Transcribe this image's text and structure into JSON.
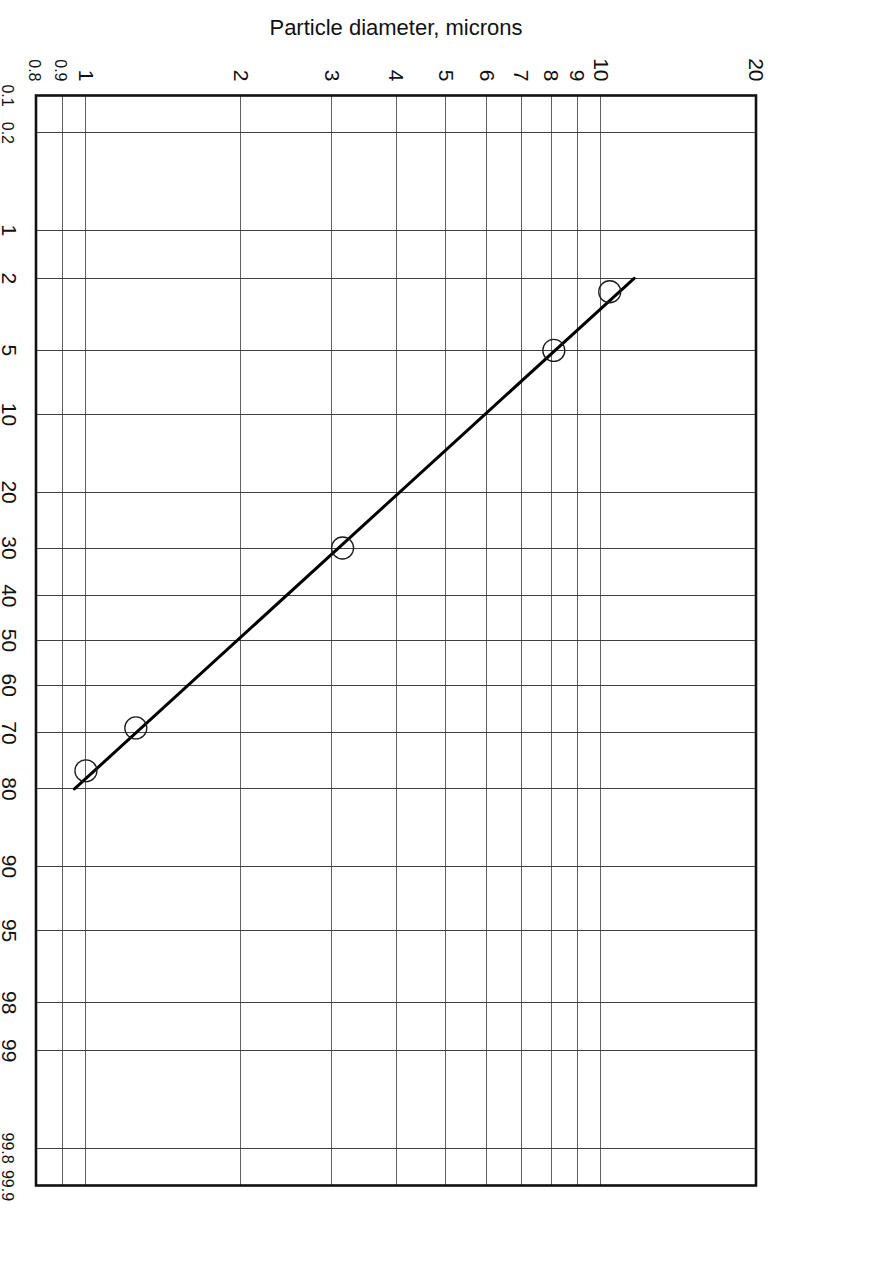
{
  "figure": {
    "orientation_deg": 90,
    "background": "#ffffff",
    "frame_color": "#111111",
    "grid_color": "#2b2b2b",
    "data_color": "#000000"
  },
  "chart_data": {
    "type": "line",
    "title": "",
    "subtitle": "",
    "xlabel": "% Greater than stated size",
    "ylabel": "Particle diameter, microns",
    "x_scale": "probability",
    "y_scale": "log",
    "xlim": [
      0.1,
      99.9
    ],
    "ylim": [
      0.8,
      20
    ],
    "grid": true,
    "legend": null,
    "x_ticks": [
      {
        "value": 0.1,
        "label": "0.1"
      },
      {
        "value": 0.2,
        "label": "0.2"
      },
      {
        "value": 1,
        "label": "1"
      },
      {
        "value": 2,
        "label": "2"
      },
      {
        "value": 5,
        "label": "5"
      },
      {
        "value": 10,
        "label": "10"
      },
      {
        "value": 20,
        "label": "20"
      },
      {
        "value": 30,
        "label": "30"
      },
      {
        "value": 40,
        "label": "40"
      },
      {
        "value": 50,
        "label": "50"
      },
      {
        "value": 60,
        "label": "60"
      },
      {
        "value": 70,
        "label": "70"
      },
      {
        "value": 80,
        "label": "80"
      },
      {
        "value": 90,
        "label": "90"
      },
      {
        "value": 95,
        "label": "95"
      },
      {
        "value": 98,
        "label": "98"
      },
      {
        "value": 99,
        "label": "99"
      },
      {
        "value": 99.8,
        "label": "99.8"
      },
      {
        "value": 99.9,
        "label": "99.9"
      }
    ],
    "y_ticks": [
      {
        "value": 0.8,
        "label": "0.8"
      },
      {
        "value": 0.9,
        "label": "0.9"
      },
      {
        "value": 1,
        "label": "1"
      },
      {
        "value": 2,
        "label": "2"
      },
      {
        "value": 3,
        "label": "3"
      },
      {
        "value": 4,
        "label": "4"
      },
      {
        "value": 5,
        "label": "5"
      },
      {
        "value": 6,
        "label": "6"
      },
      {
        "value": 7,
        "label": "7"
      },
      {
        "value": 8,
        "label": "8"
      },
      {
        "value": 9,
        "label": "9"
      },
      {
        "value": 10,
        "label": "10"
      },
      {
        "value": 20,
        "label": "20"
      }
    ],
    "series": [
      {
        "name": "particle size distribution",
        "marker": "open-circle",
        "line": "solid",
        "x": [
          2.4,
          5.0,
          30.0,
          69.0,
          77.0
        ],
        "y": [
          10.4,
          8.1,
          3.15,
          1.25,
          1.0
        ]
      }
    ],
    "fit_line": {
      "name": "best fit line",
      "x_start": 2.0,
      "y_start": 11.6,
      "x_end": 80.0,
      "y_end": 0.95
    },
    "annotations": []
  }
}
